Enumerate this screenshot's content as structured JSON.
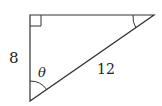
{
  "diagram": {
    "type": "right-triangle",
    "side_vertical_label": "8",
    "hypotenuse_label": "12",
    "angle_label": "θ",
    "line_color": "#333333",
    "markers": [
      "right-angle at top-left",
      "angle arc at top-right",
      "angle arc at bottom (θ)"
    ]
  }
}
